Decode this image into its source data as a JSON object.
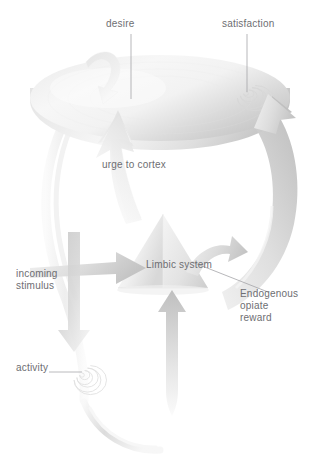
{
  "diagram": {
    "type": "flow-diagram",
    "canvas": {
      "width": 322,
      "height": 472,
      "background": "#ffffff"
    },
    "palette": {
      "label_text": "#6e6e72",
      "leader_line": "#9a9a9e",
      "disc_light": "#f4f4f4",
      "disc_mid": "#e2e2e2",
      "disc_dark": "#c6c6c6",
      "arrow_light": "#fbfbfb",
      "arrow_mid": "#e0e0e0",
      "arrow_dark": "#b9b9b9",
      "spiral": "#dcdcdc"
    },
    "labels": {
      "desire": "desire",
      "satisfaction": "satisfaction",
      "urge_to_cortex": "urge to cortex",
      "limbic_system": "Limbic system",
      "endogenous_opiate_reward": "Endogenous\nopiate\nreward",
      "incoming_stimulus": "incoming\nstimulus",
      "activity": "activity"
    },
    "nodes": [
      {
        "id": "cortex-disc",
        "shape": "ellipse",
        "label": "desire",
        "note": "large 3D cortex disc at top"
      },
      {
        "id": "limbic-pyramid",
        "shape": "triangle",
        "label": "Limbic system",
        "note": "central pyramid"
      },
      {
        "id": "satisfaction-spiral",
        "shape": "spiral",
        "label": "satisfaction",
        "note": "spiral on right of cortex disc"
      },
      {
        "id": "activity-spiral",
        "shape": "spiral",
        "label": "activity",
        "note": "spiral lower left"
      }
    ],
    "flows": [
      {
        "id": "urge-to-cortex",
        "from": "limbic-pyramid",
        "to": "cortex-disc",
        "label": "urge to cortex"
      },
      {
        "id": "endogenous-opiate-reward",
        "from": "limbic-pyramid",
        "to": "cortex-disc",
        "label": "Endogenous opiate reward"
      },
      {
        "id": "incoming-stimulus",
        "from": "external",
        "to": "limbic-pyramid",
        "label": "incoming stimulus"
      },
      {
        "id": "to-activity",
        "from": "incoming-stimulus",
        "to": "activity-spiral",
        "label": "activity"
      },
      {
        "id": "feedback-up",
        "from": "activity-spiral",
        "to": "limbic-pyramid",
        "label": ""
      }
    ]
  }
}
